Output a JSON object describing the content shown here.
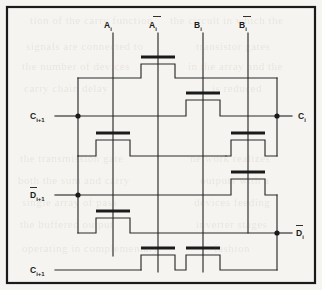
{
  "figure": {
    "kind": "circuit-schematic",
    "background_color": "#f5f4f0",
    "ink_color": "#1a1a1a",
    "frame": {
      "x": 6,
      "y": 6,
      "width": 310,
      "height": 278
    }
  },
  "labels": {
    "top": [
      {
        "id": "a-i",
        "base": "A",
        "sub": "i",
        "overline": false,
        "x": 113,
        "y": 27
      },
      {
        "id": "a-i-bar",
        "base": "A",
        "sub": "i",
        "overline": true,
        "x": 158,
        "y": 27
      },
      {
        "id": "b-i",
        "base": "B",
        "sub": "i",
        "overline": false,
        "x": 203,
        "y": 27
      },
      {
        "id": "b-i-bar",
        "base": "B",
        "sub": "i",
        "overline": true,
        "x": 248,
        "y": 27
      }
    ],
    "left": [
      {
        "id": "c-i-plus-1-top",
        "base": "C",
        "sub": "i+1",
        "overline": false,
        "x": 30,
        "y": 118
      },
      {
        "id": "d-i-plus-1-bar",
        "base": "D",
        "sub": "i+1",
        "overline": true,
        "x": 30,
        "y": 197
      },
      {
        "id": "c-i-plus-1-bottom",
        "base": "C",
        "sub": "i+1",
        "overline": false,
        "x": 30,
        "y": 268
      }
    ],
    "right": [
      {
        "id": "c-i",
        "base": "C",
        "sub": "i",
        "overline": false,
        "x": 296,
        "y": 118
      },
      {
        "id": "d-i-bar",
        "base": "D",
        "sub": "i",
        "overline": true,
        "x": 296,
        "y": 235
      }
    ]
  },
  "nodes": [
    {
      "id": "node-c-i-plus-1-top",
      "x": 78,
      "y": 116
    },
    {
      "id": "node-c-i",
      "x": 277,
      "y": 116
    },
    {
      "id": "node-d-i-plus-1-bar",
      "x": 78,
      "y": 195
    },
    {
      "id": "node-d-i-bar",
      "x": 277,
      "y": 233
    }
  ],
  "transistors": [
    {
      "id": "t1",
      "gate_signal": "A-bar-i",
      "bar_x": 141,
      "bar_y": 57,
      "bar_w": 34
    },
    {
      "id": "t2",
      "gate_signal": "B-i",
      "bar_x": 186,
      "bar_y": 93,
      "bar_w": 34
    },
    {
      "id": "t3",
      "gate_signal": "A-i",
      "bar_x": 96,
      "bar_y": 133,
      "bar_w": 34
    },
    {
      "id": "t4",
      "gate_signal": "B-bar-i",
      "bar_x": 231,
      "bar_y": 133,
      "bar_w": 34
    },
    {
      "id": "t5",
      "gate_signal": "B-bar-i",
      "bar_x": 231,
      "bar_y": 172,
      "bar_w": 34
    },
    {
      "id": "t6",
      "gate_signal": "A-i",
      "bar_x": 96,
      "bar_y": 211,
      "bar_w": 34
    },
    {
      "id": "t7",
      "gate_signal": "A-bar-i",
      "bar_x": 141,
      "bar_y": 248,
      "bar_w": 34
    },
    {
      "id": "t8",
      "gate_signal": "B-i",
      "bar_x": 186,
      "bar_y": 248,
      "bar_w": 34
    }
  ],
  "columns": [
    {
      "id": "col-a-i",
      "x": 113,
      "y_top": 33,
      "y_bottom": 256
    },
    {
      "id": "col-a-bar-i",
      "x": 158,
      "y_top": 33,
      "y_bottom": 272
    },
    {
      "id": "col-b-i",
      "x": 203,
      "y_top": 33,
      "y_bottom": 272
    },
    {
      "id": "col-b-bar-i",
      "x": 248,
      "y_top": 33,
      "y_bottom": 233
    }
  ],
  "ghost_text": {
    "note": "faint show-through of printed page text behind the figure",
    "lines": [
      {
        "text": "tion of the carry function",
        "x": 30,
        "y": 14
      },
      {
        "text": "the circuit in which the",
        "x": 170,
        "y": 14
      },
      {
        "text": "signals are connected to",
        "x": 26,
        "y": 40
      },
      {
        "text": "transistor gates",
        "x": 196,
        "y": 40
      },
      {
        "text": "the number of devices",
        "x": 22,
        "y": 60
      },
      {
        "text": "in the array and the",
        "x": 188,
        "y": 60
      },
      {
        "text": "carry chain delay",
        "x": 24,
        "y": 82
      },
      {
        "text": "is reduced",
        "x": 212,
        "y": 82
      },
      {
        "text": "the transmission gate",
        "x": 20,
        "y": 152
      },
      {
        "text": "network realizes",
        "x": 190,
        "y": 152
      },
      {
        "text": "both the sum and carry",
        "x": 18,
        "y": 174
      },
      {
        "text": "outputs with a",
        "x": 200,
        "y": 174
      },
      {
        "text": "single array of pass",
        "x": 22,
        "y": 196
      },
      {
        "text": "devices feeding",
        "x": 194,
        "y": 196
      },
      {
        "text": "the buffered output",
        "x": 20,
        "y": 218
      },
      {
        "text": "inverter stages",
        "x": 196,
        "y": 218
      },
      {
        "text": "operating in complementary",
        "x": 22,
        "y": 242
      },
      {
        "text": "fashion",
        "x": 214,
        "y": 242
      }
    ]
  }
}
